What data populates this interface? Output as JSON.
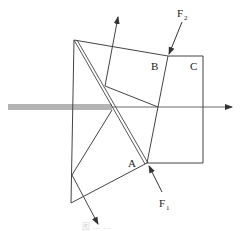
{
  "diagram": {
    "type": "optical prism assembly (beam splitter)",
    "labels": {
      "A": "A",
      "B": "B",
      "C": "C",
      "F1_main": "F",
      "F1_sub": "1",
      "F2_main": "F",
      "F2_sub": "2"
    },
    "caption": "图 … …",
    "colors": {
      "stroke": "#333333",
      "background": "#ffffff"
    }
  }
}
